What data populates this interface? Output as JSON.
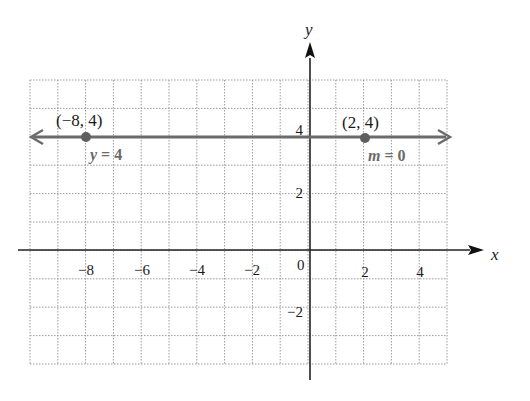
{
  "chart_data": {
    "type": "line",
    "title": "",
    "xlabel": "x",
    "ylabel": "y",
    "xlim": [
      -10,
      5
    ],
    "ylim": [
      -4,
      6
    ],
    "grid": true,
    "grid_style": "dotted",
    "x_ticks": [
      -8,
      -6,
      -4,
      -2,
      2,
      4
    ],
    "x_tick_labels": [
      "−8",
      "−6",
      "−4",
      "−2",
      "2",
      "4"
    ],
    "y_ticks": [
      4,
      2,
      -2
    ],
    "y_tick_labels": [
      "4",
      "2",
      "−2"
    ],
    "origin_label": "0",
    "series": [
      {
        "name": "y = 4",
        "equation": "y = 4",
        "slope_label": "m = 0",
        "x": [
          -10,
          5
        ],
        "y": [
          4,
          4
        ],
        "color": "#6b6b6b",
        "arrows_both_ends": true
      }
    ],
    "points": [
      {
        "x": -8,
        "y": 4,
        "label": "(−8, 4)"
      },
      {
        "x": 2,
        "y": 4,
        "label": "(2, 4)"
      }
    ],
    "annotations": [
      {
        "text": "y = 4",
        "near": [
          -8,
          4
        ],
        "position": "below-right"
      },
      {
        "text": "m = 0",
        "near": [
          2,
          4
        ],
        "position": "below-right"
      }
    ]
  },
  "colors": {
    "line": "#6b6b6b",
    "axis": "#222222",
    "grid": "#9a9a9a",
    "point": "#5e5e5e"
  },
  "labels": {
    "x_axis": "x",
    "y_axis": "y",
    "origin": "0",
    "point_left": "(−8, 4)",
    "point_right": "(2, 4)",
    "equation": "y = 4",
    "slope": "m = 0",
    "xticks": [
      "−8",
      "−6",
      "−4",
      "−2",
      "2",
      "4"
    ],
    "yticks": [
      "4",
      "2",
      "−2"
    ]
  }
}
